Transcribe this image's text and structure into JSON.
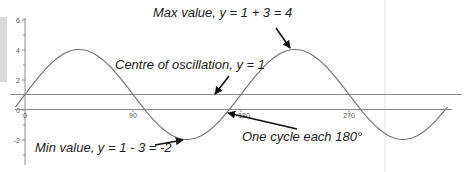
{
  "chart_data": {
    "type": "line",
    "title": "",
    "xlabel": "",
    "ylabel": "",
    "function": "y = 1 + 3 sin(2x)",
    "xlim": [
      -8,
      355
    ],
    "ylim": [
      -3,
      6.2
    ],
    "x_ticks": [
      0,
      90,
      180,
      270
    ],
    "x_tick_labels": [
      "0",
      "90",
      "180",
      "270"
    ],
    "y_ticks": [
      -2,
      0,
      2,
      4,
      6
    ],
    "y_tick_labels": [
      "-2",
      "0",
      "2",
      "4",
      "6"
    ],
    "grid": false,
    "series": [
      {
        "name": "y = 1 + 3 sin 2x",
        "x": [
          0,
          45,
          90,
          135,
          180,
          225,
          270,
          315
        ],
        "values": [
          1,
          4,
          1,
          -2,
          1,
          4,
          1,
          -2
        ]
      }
    ],
    "reference_lines": [
      {
        "name": "centre of oscillation",
        "y": 1
      },
      {
        "name": "x-axis",
        "y": 0
      }
    ],
    "annotations": [
      {
        "text": "Max value, y = 1 + 3 = 4",
        "points_to": [
          225,
          4
        ]
      },
      {
        "text": "Centre of oscillation, y = 1",
        "points_to": [
          150,
          1
        ]
      },
      {
        "text": "Min value, y = 1 - 3 = -2",
        "points_to": [
          135,
          -2
        ]
      },
      {
        "text": "One cycle each 180°",
        "points_to": [
          180,
          0
        ]
      }
    ]
  },
  "labels": {
    "x_ticks": [
      "0",
      "90",
      "180",
      "270"
    ],
    "y_ticks": [
      "6",
      "4",
      "2",
      "0",
      "-2"
    ],
    "max_annotation": "Max value, y = 1 + 3 = 4",
    "centre_annotation": "Centre of oscillation, y = 1",
    "min_annotation": "Min value, y = 1 - 3 = -2",
    "cycle_annotation": "One cycle each 180°"
  },
  "colors": {
    "curve": "#707070",
    "axis": "#8a8a8a",
    "text": "#1a1a1a",
    "arrow": "#111111",
    "side_bar": "#d9d9d9"
  }
}
